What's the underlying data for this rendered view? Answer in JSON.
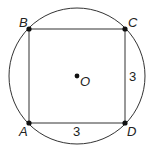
{
  "diagram": {
    "circle": {
      "center_label": "O",
      "cx": 77,
      "cy": 76,
      "r": 68
    },
    "points": [
      {
        "label": "A",
        "x": 29,
        "y": 123
      },
      {
        "label": "B",
        "x": 29,
        "y": 29
      },
      {
        "label": "C",
        "x": 125,
        "y": 29
      },
      {
        "label": "D",
        "x": 125,
        "y": 123
      }
    ],
    "side_labels": {
      "CD": "3",
      "AD": "3"
    },
    "colors": {
      "stroke": "#222222",
      "background": "#ffffff"
    }
  }
}
